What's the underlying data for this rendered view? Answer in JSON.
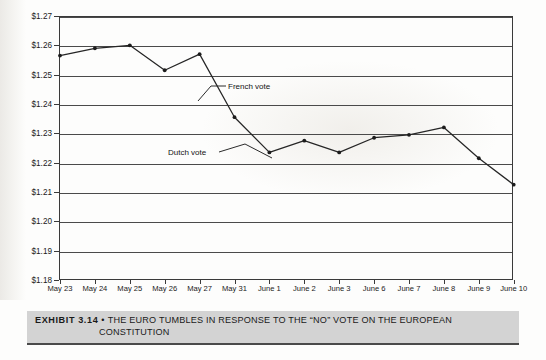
{
  "figure": {
    "exhibit_label": "EXHIBIT 3.14",
    "separator": "•",
    "caption_line1": "THE EURO TUMBLES IN RESPONSE TO THE “NO” VOTE ON THE EUROPEAN",
    "caption_line2": "CONSTITUTION",
    "background_color": "#ffffff",
    "caption_bar_color": "#d3d3d3",
    "line_color": "#262626",
    "grid_color": "#4a4a4a"
  },
  "annotations": [
    {
      "name": "french-vote",
      "label": "French vote"
    },
    {
      "name": "dutch-vote",
      "label": "Dutch vote"
    }
  ],
  "axes": {
    "y_ticks": [
      "$1.27",
      "$1.26",
      "$1.25",
      "$1.24",
      "$1.23",
      "$1.22",
      "$1.21",
      "$1.20",
      "$1.19",
      "$1.18"
    ],
    "x_ticks": [
      "May 23",
      "May 24",
      "May 25",
      "May 26",
      "May 27",
      "May 31",
      "June 1",
      "June 2",
      "June 3",
      "June 6",
      "June 7",
      "June 8",
      "June 9",
      "June 10"
    ]
  },
  "chart_data": {
    "type": "line",
    "title": "THE EURO TUMBLES IN RESPONSE TO THE “NO” VOTE ON THE EUROPEAN CONSTITUTION",
    "xlabel": "",
    "ylabel": "",
    "categories": [
      "May 23",
      "May 24",
      "May 25",
      "May 26",
      "May 27",
      "May 31",
      "June 1",
      "June 2",
      "June 3",
      "June 6",
      "June 7",
      "June 8",
      "June 9",
      "June 10"
    ],
    "values": [
      1.2565,
      1.259,
      1.26,
      1.2515,
      1.257,
      1.2355,
      1.2235,
      1.2275,
      1.2235,
      1.2285,
      1.2295,
      1.232,
      1.2215,
      1.2125
    ],
    "series": [
      {
        "name": "Euro exchange rate (USD per EUR)",
        "values": [
          1.2565,
          1.259,
          1.26,
          1.2515,
          1.257,
          1.2355,
          1.2235,
          1.2275,
          1.2235,
          1.2285,
          1.2295,
          1.232,
          1.2215,
          1.2125
        ]
      }
    ],
    "ylim": [
      1.18,
      1.27
    ],
    "ytick_step": 0.01,
    "ytick_format": "$1.00",
    "grid": true,
    "grid_axis": "y",
    "legend": "none",
    "markers": true,
    "annotations": [
      {
        "text": "French vote",
        "points_to": "May 27 → May 31 decline"
      },
      {
        "text": "Dutch vote",
        "points_to": "June 1 trough"
      }
    ]
  }
}
